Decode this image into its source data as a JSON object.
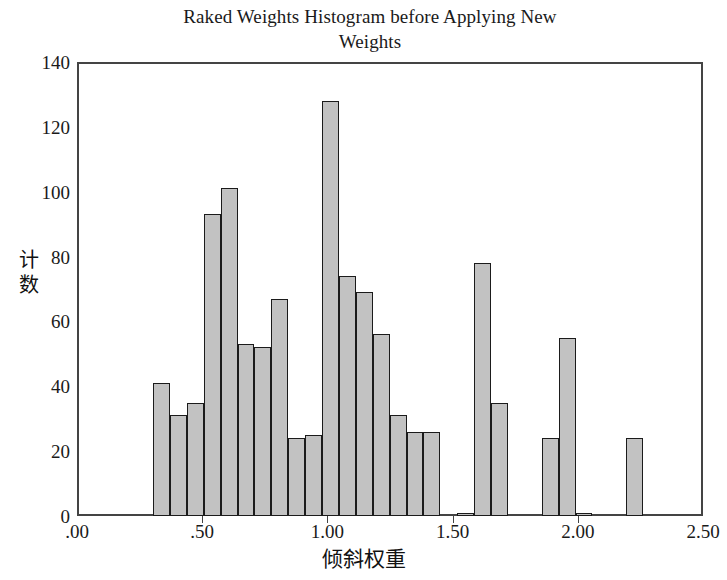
{
  "chart_data": {
    "type": "bar",
    "title": "Raked Weights Histogram before Applying New\nWeights",
    "xlabel": "倾斜权重",
    "ylabel": "计数",
    "ylabel_chars": [
      "计",
      "数"
    ],
    "xlim": [
      0.0,
      2.5
    ],
    "ylim": [
      0,
      140
    ],
    "ytick_labels": [
      "0",
      "20",
      "40",
      "60",
      "80",
      "100",
      "120",
      "140"
    ],
    "ytick_values": [
      0,
      20,
      40,
      60,
      80,
      100,
      120,
      140
    ],
    "xtick_labels": [
      ".00",
      ".50",
      "1.00",
      "1.50",
      "2.00",
      "2.50"
    ],
    "xtick_values": [
      0.0,
      0.5,
      1.0,
      1.5,
      2.0,
      2.5
    ],
    "grid": false,
    "legend": null,
    "bin_width": 0.0675,
    "bar_fill_color": "#c2c2c2",
    "bar_edge_color": "#1b1b1b",
    "axis_color": "#444444",
    "background_color": "#ffffff",
    "bins": [
      {
        "x": 0.3375,
        "value": 41
      },
      {
        "x": 0.405,
        "value": 31
      },
      {
        "x": 0.4725,
        "value": 35
      },
      {
        "x": 0.54,
        "value": 93
      },
      {
        "x": 0.6075,
        "value": 101
      },
      {
        "x": 0.675,
        "value": 53
      },
      {
        "x": 0.7425,
        "value": 52
      },
      {
        "x": 0.81,
        "value": 67
      },
      {
        "x": 0.8775,
        "value": 24
      },
      {
        "x": 0.945,
        "value": 25
      },
      {
        "x": 1.0125,
        "value": 128
      },
      {
        "x": 1.08,
        "value": 74
      },
      {
        "x": 1.1475,
        "value": 69
      },
      {
        "x": 1.215,
        "value": 56
      },
      {
        "x": 1.2825,
        "value": 31
      },
      {
        "x": 1.35,
        "value": 26
      },
      {
        "x": 1.4175,
        "value": 26
      },
      {
        "x": 1.5525,
        "value": 1
      },
      {
        "x": 1.62,
        "value": 78
      },
      {
        "x": 1.6875,
        "value": 35
      },
      {
        "x": 1.89,
        "value": 24
      },
      {
        "x": 1.9575,
        "value": 55
      },
      {
        "x": 2.025,
        "value": 1
      },
      {
        "x": 2.2275,
        "value": 24
      }
    ]
  }
}
